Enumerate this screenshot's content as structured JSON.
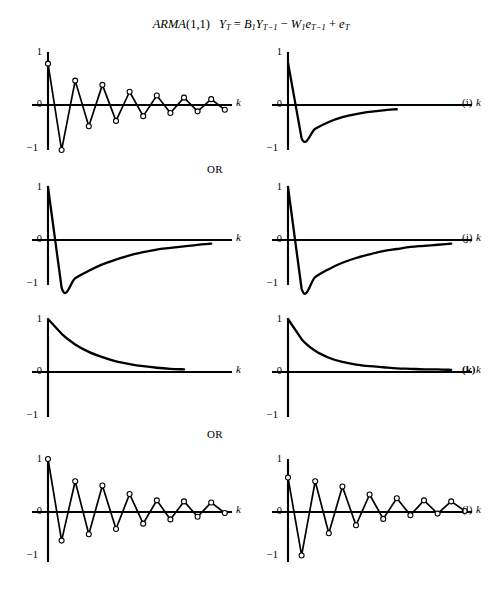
{
  "figure": {
    "title_model": "ARMA",
    "title_order": "(1,1)",
    "title_eq_lhs": "Y",
    "title_eq_lhs_sub": "T",
    "title_eq_eq": "=",
    "title_eq_b": "B",
    "title_eq_b_sub": "1",
    "title_eq_y2": "Y",
    "title_eq_y2_sub": "T−1",
    "title_eq_minus": "−",
    "title_eq_w": "W",
    "title_eq_w_sub": "1",
    "title_eq_e1": "e",
    "title_eq_e1_sub": "T−1",
    "title_eq_plus": "+",
    "title_eq_e2": "e",
    "title_eq_e2_sub": "T",
    "or_label_1": "OR",
    "or_label_2": "OR",
    "axis": {
      "y_top": "1",
      "y_mid": "0",
      "y_bottom": "−1",
      "x_label": "k"
    },
    "tags": {
      "i": "(i)",
      "j": "(j)",
      "k": "(k)",
      "l": "(l)"
    }
  },
  "chart_data": [
    {
      "id": "i-left",
      "type": "line",
      "title": "ARMA(1,1) ACF — case (i)",
      "xlabel": "k",
      "ylabel": "",
      "ylim": [
        -1,
        1
      ],
      "xlim": [
        0,
        14
      ],
      "grid": false,
      "legend": "none",
      "markers": "open-circle",
      "x": [
        0,
        1,
        2,
        3,
        4,
        5,
        6,
        7,
        8,
        9,
        10,
        11,
        12,
        13
      ],
      "values": [
        0.78,
        -0.85,
        0.46,
        -0.4,
        0.38,
        -0.3,
        0.25,
        -0.21,
        0.18,
        -0.15,
        0.14,
        -0.12,
        0.11,
        -0.09
      ]
    },
    {
      "id": "i-right",
      "type": "line",
      "title": "ARMA(1,1) PACF — case (i)",
      "xlabel": "k",
      "ylabel": "",
      "ylim": [
        -1,
        1
      ],
      "xlim": [
        0,
        14
      ],
      "grid": false,
      "legend": "none",
      "markers": "none",
      "x": [
        0,
        1,
        2,
        3,
        4,
        5,
        6,
        7,
        8
      ],
      "values": [
        0.8,
        -0.63,
        -0.45,
        -0.32,
        -0.23,
        -0.17,
        -0.13,
        -0.1,
        -0.08
      ]
    },
    {
      "id": "j-left",
      "type": "line",
      "title": "ARMA(1,1) ACF — case (j)",
      "xlabel": "k",
      "ylabel": "",
      "ylim": [
        -1,
        1
      ],
      "xlim": [
        0,
        14
      ],
      "grid": false,
      "legend": "none",
      "markers": "none",
      "x": [
        0,
        1,
        2,
        3,
        4,
        5,
        6,
        7,
        8,
        9,
        10,
        11,
        12
      ],
      "values": [
        1.0,
        -0.9,
        -0.72,
        -0.58,
        -0.46,
        -0.37,
        -0.29,
        -0.23,
        -0.18,
        -0.15,
        -0.12,
        -0.09,
        -0.07
      ]
    },
    {
      "id": "j-right",
      "type": "line",
      "title": "ARMA(1,1) PACF — case (j)",
      "xlabel": "k",
      "ylabel": "",
      "ylim": [
        -1,
        1
      ],
      "xlim": [
        0,
        14
      ],
      "grid": false,
      "legend": "none",
      "markers": "none",
      "x": [
        0,
        1,
        2,
        3,
        4,
        5,
        6,
        7,
        8,
        9,
        10,
        11,
        12
      ],
      "values": [
        1.0,
        -0.92,
        -0.7,
        -0.55,
        -0.43,
        -0.34,
        -0.27,
        -0.21,
        -0.17,
        -0.13,
        -0.11,
        -0.09,
        -0.07
      ]
    },
    {
      "id": "k-left",
      "type": "line",
      "title": "ARMA(1,1) ACF — case (k)",
      "xlabel": "k",
      "ylabel": "",
      "ylim": [
        -1,
        1
      ],
      "xlim": [
        0,
        14
      ],
      "grid": false,
      "legend": "none",
      "markers": "none",
      "x": [
        0,
        1,
        2,
        3,
        4,
        5,
        6,
        7,
        8,
        9,
        10
      ],
      "values": [
        1.0,
        0.72,
        0.52,
        0.38,
        0.28,
        0.2,
        0.15,
        0.11,
        0.08,
        0.06,
        0.05
      ]
    },
    {
      "id": "k-right",
      "type": "line",
      "title": "ARMA(1,1) PACF — case (k)",
      "xlabel": "k",
      "ylabel": "",
      "ylim": [
        -1,
        1
      ],
      "xlim": [
        0,
        14
      ],
      "grid": false,
      "legend": "none",
      "markers": "none",
      "x": [
        0,
        1,
        2,
        3,
        4,
        5,
        6,
        7,
        8,
        9,
        10,
        11,
        12
      ],
      "values": [
        1.0,
        0.62,
        0.4,
        0.27,
        0.19,
        0.14,
        0.11,
        0.09,
        0.07,
        0.06,
        0.05,
        0.05,
        0.04
      ]
    },
    {
      "id": "l-left",
      "type": "line",
      "title": "ARMA(1,1) ACF — case (l)",
      "xlabel": "k",
      "ylabel": "",
      "ylim": [
        -1,
        1
      ],
      "xlim": [
        0,
        14
      ],
      "grid": false,
      "legend": "none",
      "markers": "open-circle",
      "x": [
        0,
        1,
        2,
        3,
        4,
        5,
        6,
        7,
        8,
        9,
        10,
        11,
        12,
        13
      ],
      "values": [
        1.0,
        -0.54,
        0.58,
        -0.42,
        0.5,
        -0.32,
        0.34,
        -0.22,
        0.22,
        -0.14,
        0.2,
        -0.09,
        0.18,
        -0.02
      ]
    },
    {
      "id": "l-right",
      "type": "line",
      "title": "ARMA(1,1) PACF — case (l)",
      "xlabel": "k",
      "ylabel": "",
      "ylim": [
        -1,
        1
      ],
      "xlim": [
        0,
        14
      ],
      "grid": false,
      "legend": "none",
      "markers": "open-circle",
      "x": [
        0,
        1,
        2,
        3,
        4,
        5,
        6,
        7,
        8,
        9,
        10,
        11,
        12,
        13
      ],
      "values": [
        0.65,
        -0.82,
        0.58,
        -0.4,
        0.48,
        -0.25,
        0.33,
        -0.13,
        0.26,
        -0.06,
        0.22,
        -0.03,
        0.2,
        0.02
      ]
    }
  ]
}
